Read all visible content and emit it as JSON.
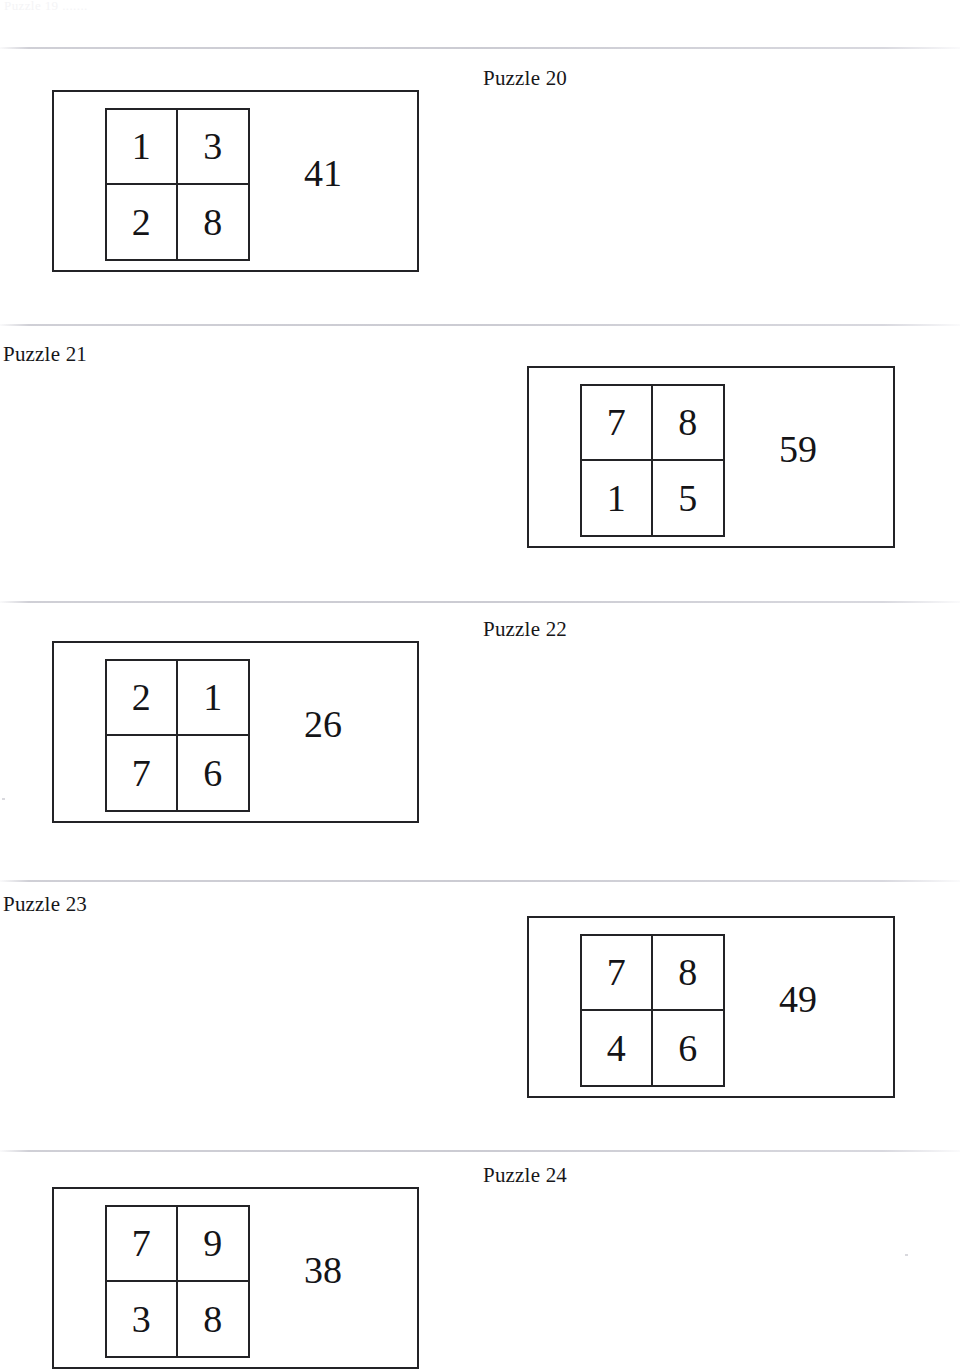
{
  "page": {
    "background_color": "#ffffff",
    "ink_color": "#1a1a1a",
    "rule_color": "#c8c8d0",
    "top_artifact_text": "Puzzle 19 .......",
    "separator_rules_y": [
      47,
      324,
      601,
      880,
      1150
    ]
  },
  "puzzles": [
    {
      "label": "Puzzle 20",
      "label_position": "center",
      "label_x": 483,
      "label_y": 68,
      "box_side": "left",
      "box_top": 90,
      "box_height": 182,
      "grid": [
        [
          "1",
          "3"
        ],
        [
          "2",
          "8"
        ]
      ],
      "answer": "41",
      "answer_x": 302,
      "answer_y": 162
    },
    {
      "label": "Puzzle 21",
      "label_position": "left",
      "label_x": 3,
      "label_y": 344,
      "box_side": "right",
      "box_top": 366,
      "box_height": 182,
      "grid": [
        [
          "7",
          "8"
        ],
        [
          "1",
          "5"
        ]
      ],
      "answer": "59",
      "answer_x": 252,
      "answer_y": 162
    },
    {
      "label": "Puzzle 22",
      "label_position": "center",
      "label_x": 483,
      "label_y": 619,
      "box_side": "left",
      "box_top": 641,
      "box_height": 182,
      "grid": [
        [
          "2",
          "1"
        ],
        [
          "7",
          "6"
        ]
      ],
      "answer": "26",
      "answer_x": 251,
      "answer_y": 162
    },
    {
      "label": "Puzzle 23",
      "label_position": "left",
      "label_x": 3,
      "label_y": 894,
      "box_side": "right",
      "box_top": 916,
      "box_height": 182,
      "grid": [
        [
          "7",
          "8"
        ],
        [
          "4",
          "6"
        ]
      ],
      "answer": "49",
      "answer_x": 252,
      "answer_y": 162
    },
    {
      "label": "Puzzle 24",
      "label_position": "center",
      "label_x": 483,
      "label_y": 1165,
      "box_side": "left",
      "box_top": 1187,
      "box_height": 182,
      "grid": [
        [
          "7",
          "9"
        ],
        [
          "3",
          "8"
        ]
      ],
      "answer": "38",
      "answer_x": 251,
      "answer_y": 162
    }
  ]
}
